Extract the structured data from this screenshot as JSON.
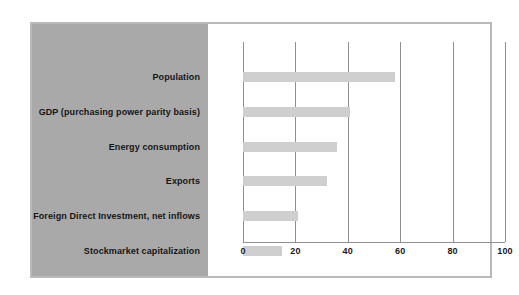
{
  "chart_data": {
    "type": "bar",
    "orientation": "horizontal",
    "title": "",
    "subtitle": "",
    "xlabel": "",
    "ylabel": "",
    "categories": [
      "Population",
      "GDP (purchasing power parity basis)",
      "Energy consumption",
      "Exports",
      "Foreign Direct Investment, net inflows",
      "Stockmarket capitalization"
    ],
    "values": [
      58,
      41,
      36,
      32,
      21,
      15
    ],
    "xlim": [
      0,
      100
    ],
    "xticks": [
      0,
      20,
      40,
      60,
      80,
      100
    ],
    "xtick_labels": [
      "0",
      "20",
      "40",
      "60",
      "80",
      "100"
    ],
    "grid": "vertical",
    "legend": "none",
    "bar_color": "#cfcfcf",
    "gridline_color": "#8f8f8f",
    "label_panel_color": "#a9a9a9",
    "plot_background": "#ffffff",
    "frame_color": "#b9b9b9",
    "text_color": "#161616"
  }
}
